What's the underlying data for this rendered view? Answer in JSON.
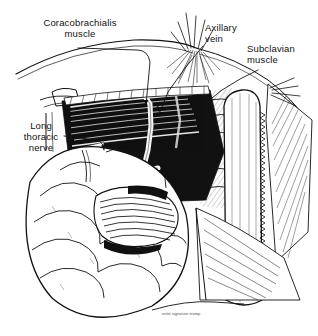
{
  "figure": {
    "medium": "black ink line drawing on white background",
    "background_color": "#ffffff",
    "ink_color": "#111111",
    "signature": "artist signature stamp"
  },
  "labels": [
    {
      "id": "coracobrachialis",
      "text": "Coracobrachialis\nmuscle",
      "name": "label-coracobrachialis-muscle"
    },
    {
      "id": "axillary_vein",
      "text": "Axillary\nvein",
      "name": "label-axillary-vein"
    },
    {
      "id": "subclavian",
      "text": "Subclavian\nmuscle",
      "name": "label-subclavian-muscle"
    },
    {
      "id": "long_thoracic",
      "text": "Long\nthoracic\nnerve",
      "name": "label-long-thoracic-nerve"
    }
  ],
  "leader_lines": [
    {
      "from": "coracobrachialis",
      "to": "coracobrachialis muscle belly"
    },
    {
      "from": "axillary_vein",
      "to": "axillary vein within axilla"
    },
    {
      "from": "subclavian",
      "to": "subclavian muscle"
    },
    {
      "from": "long_thoracic",
      "to": "long thoracic nerve on chest wall"
    }
  ],
  "structures": [
    {
      "name": "skin-flap-edge",
      "description": "retracted skin margin arc across upper field"
    },
    {
      "name": "coracobrachialis-muscle",
      "description": "dark striated muscle band upper left of cavity"
    },
    {
      "name": "axillary-cavity",
      "description": "deep dark axillary space"
    },
    {
      "name": "axillary-vein",
      "description": "pale vessel strand descending in axilla"
    },
    {
      "name": "subclavian-muscle",
      "description": "pale elongated rounded muscle at right"
    },
    {
      "name": "long-thoracic-nerve",
      "description": "fine nerve strand on serratus anterior"
    },
    {
      "name": "pectoralis-major",
      "description": "large lobulated muscle mass lower left"
    },
    {
      "name": "serratus-anterior",
      "description": "hatched chest wall ribs and muscle right of centre"
    },
    {
      "name": "retractor-edges",
      "description": "fine hatched wound margins"
    }
  ]
}
